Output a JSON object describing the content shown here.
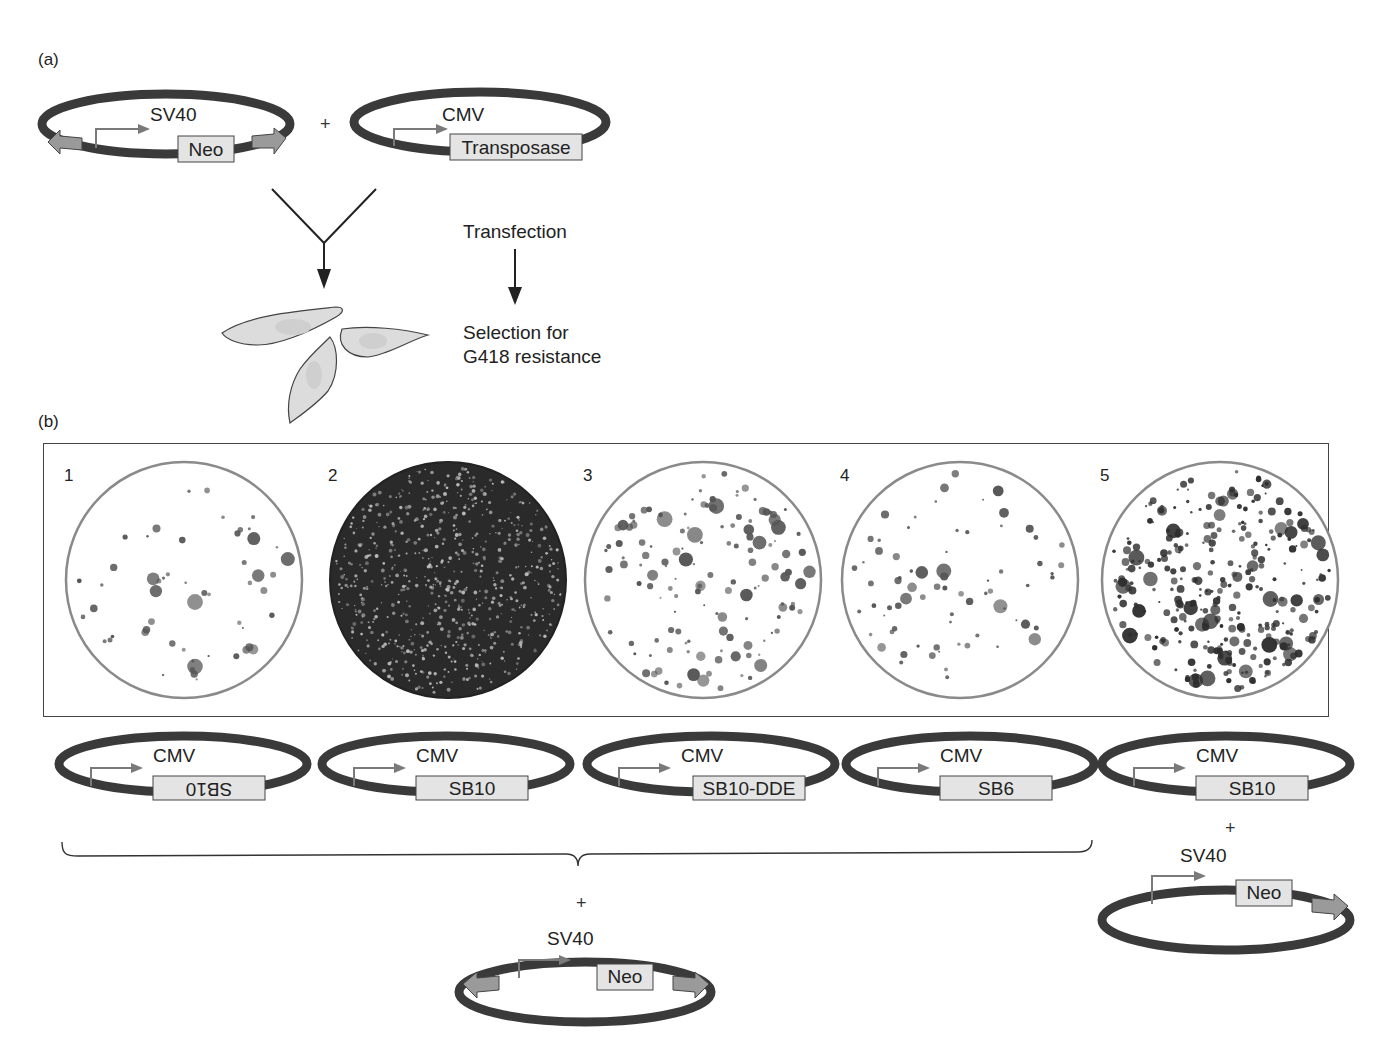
{
  "figure": {
    "panel_a": {
      "label": "(a)",
      "plasmid_left": {
        "promoter": "SV40",
        "gene": "Neo",
        "flanking_arrows": true
      },
      "plus": "+",
      "plasmid_right": {
        "promoter": "CMV",
        "gene": "Transposase"
      },
      "step1": "Transfection",
      "step2_line1": "Selection for",
      "step2_line2": "G418 resistance",
      "cells_icon": "cultured-cells"
    },
    "panel_b": {
      "label": "(b)",
      "plates": [
        {
          "number": "1",
          "density": "low",
          "style": "sparse-colonies"
        },
        {
          "number": "2",
          "density": "confluent",
          "style": "dark-lawn"
        },
        {
          "number": "3",
          "density": "medium",
          "style": "medium-colonies"
        },
        {
          "number": "4",
          "density": "low-medium",
          "style": "sparse-colonies"
        },
        {
          "number": "5",
          "density": "high",
          "style": "dense-colonies"
        }
      ],
      "transposase_plasmids": [
        {
          "promoter": "CMV",
          "gene": "SB10",
          "inverted": true
        },
        {
          "promoter": "CMV",
          "gene": "SB10",
          "inverted": false
        },
        {
          "promoter": "CMV",
          "gene": "SB10-DDE",
          "inverted": false
        },
        {
          "promoter": "CMV",
          "gene": "SB6",
          "inverted": false
        },
        {
          "promoter": "CMV",
          "gene": "SB10",
          "inverted": false
        }
      ],
      "shared_plus": "+",
      "shared_donor": {
        "promoter": "SV40",
        "gene": "Neo",
        "flanking_arrows": true
      },
      "lane5_plus": "+",
      "lane5_donor": {
        "promoter": "SV40",
        "gene": "Neo",
        "flanking_arrows": false
      }
    },
    "colors": {
      "plasmid_backbone": "#3a3a3a",
      "gene_box": "#e4e4e4",
      "promoter_arrow": "#7a7a7a",
      "ir_arrow": "#9a9a9a",
      "plate_rim": "#8a8a8a",
      "colony": "#555555",
      "cell_fill": "#dcdcdc"
    }
  }
}
